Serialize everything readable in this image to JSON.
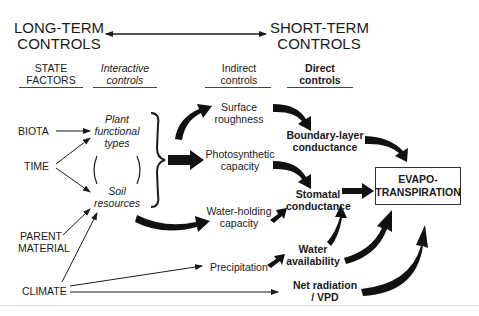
{
  "headers": {
    "long_term": [
      "LONG-TERM",
      "CONTROLS"
    ],
    "short_term": [
      "SHORT-TERM",
      "CONTROLS"
    ]
  },
  "columns": {
    "state_factors": [
      "STATE",
      "FACTORS"
    ],
    "interactive": [
      "Interactive",
      "controls"
    ],
    "indirect": [
      "Indirect",
      "controls"
    ],
    "direct": [
      "Direct",
      "controls"
    ]
  },
  "state_factors": {
    "biota": "BIOTA",
    "time": "TIME",
    "parent_material": [
      "PARENT",
      "MATERIAL"
    ],
    "climate": "CLIMATE"
  },
  "interactive_controls": {
    "plant_types": [
      "Plant",
      "functional",
      "types"
    ],
    "soil_resources": [
      "Soil",
      "resources"
    ]
  },
  "indirect_controls": {
    "surface_roughness": [
      "Surface",
      "roughness"
    ],
    "photosynthetic_capacity": [
      "Photosynthetic",
      "capacity"
    ],
    "water_holding_capacity": [
      "Water-holding",
      "capacity"
    ],
    "precipitation": "Precipitation"
  },
  "direct_controls": {
    "boundary_layer": [
      "Boundary-layer",
      "conductance"
    ],
    "stomatal": [
      "Stomatal",
      "conductance"
    ],
    "water_availability": [
      "Water",
      "availability"
    ],
    "net_radiation": [
      "Net radiation",
      "/ VPD"
    ]
  },
  "outcome": [
    "EVAPO-",
    "TRANSPIRATION"
  ]
}
